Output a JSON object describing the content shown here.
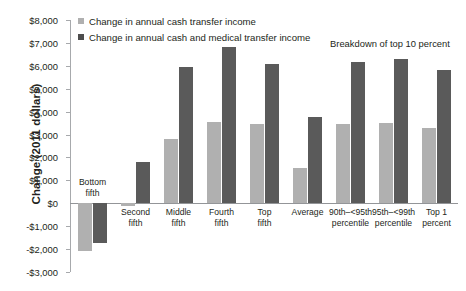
{
  "chart_data": {
    "type": "bar",
    "title": "",
    "xlabel": "",
    "ylabel": "Change (2011 dollars)",
    "ylim": [
      -3000,
      8000
    ],
    "ytick_step": 1000,
    "grid": false,
    "legend_position": "top-left",
    "categories": [
      "Bottom\nfifth",
      "Second\nfifth",
      "Middle\nfifth",
      "Fourth\nfifth",
      "Top\nfifth",
      "Average",
      "90th–<95th\npercentile",
      "95th–<99th\npercentile",
      "Top 1\npercent"
    ],
    "ytick_labels": [
      "$8,000",
      "$7,000",
      "$6,000",
      "$5,000",
      "$4,000",
      "$3,000",
      "$2,000",
      "$1,000",
      "$0",
      "-$1,000",
      "-$2,000",
      "-$3,000"
    ],
    "ytick_values": [
      8000,
      7000,
      6000,
      5000,
      4000,
      3000,
      2000,
      1000,
      0,
      -1000,
      -2000,
      -3000
    ],
    "series": [
      {
        "name": "Change in annual cash transfer income",
        "color": "#b0b0b0",
        "values": [
          -2100,
          -100,
          2800,
          3550,
          3450,
          1550,
          3450,
          3500,
          3300
        ]
      },
      {
        "name": "Change in annual cash and medical transfer income",
        "color": "#5a5a5a",
        "values": [
          -1750,
          1800,
          5950,
          6800,
          6100,
          3750,
          6150,
          6300,
          5800
        ]
      }
    ],
    "annotations": [
      {
        "text": "Breakdown of top 10 percent"
      }
    ]
  },
  "legend": {
    "items": [
      {
        "label": "Change in annual cash transfer income",
        "swatch": "light"
      },
      {
        "label": "Change in annual cash and medical transfer income",
        "swatch": "dark"
      }
    ]
  }
}
